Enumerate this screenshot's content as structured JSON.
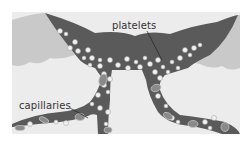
{
  "diagram": {
    "labels": {
      "platelets": "platelets",
      "capillaries": "capillaries"
    },
    "colors": {
      "vessel": "#5a5a5a",
      "tissue": "#c9c9c9",
      "background": "#ececec",
      "cell": "#f4f4f4",
      "red_cell": "#8a8a8a"
    }
  }
}
